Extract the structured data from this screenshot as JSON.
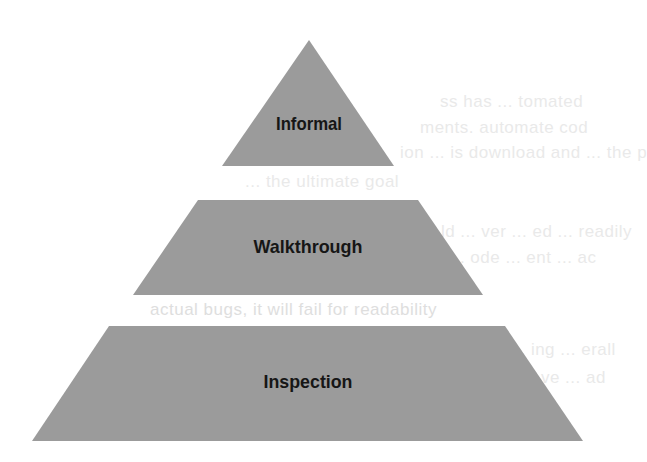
{
  "diagram": {
    "type": "pyramid",
    "fill_color": "#9b9b9b",
    "label_color": "#161616",
    "background_color": "#ffffff",
    "levels": [
      {
        "label": "Informal",
        "shape": "triangle",
        "points": "309,40 394,166 222,166",
        "label_x": 309,
        "label_y": 130
      },
      {
        "label": "Walkthrough",
        "shape": "trapezoid",
        "points": "198,200 418,200 483,295 133,295",
        "label_x": 308,
        "label_y": 253
      },
      {
        "label": "Inspection",
        "shape": "trapezoid",
        "points": "109,326 505,326 583,441 32,441",
        "label_x": 308,
        "label_y": 388
      }
    ]
  },
  "show_through_text": [
    "ss has ... tomated",
    "ments. automate cod",
    "ion ... is download and ... the p",
    "... the ultimate goal",
    "... ld ... ver ... ed ... readily",
    "al ... ode ... ent ... ac",
    "actual bugs, it will fail for readability",
    "... ing ... erall",
    "... ve ... ad"
  ]
}
